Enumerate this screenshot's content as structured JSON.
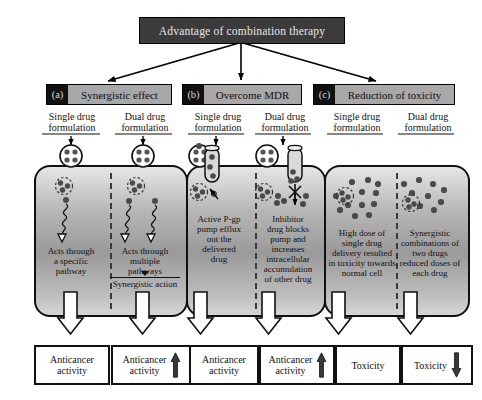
{
  "title": {
    "text": "Advantage of combination therapy"
  },
  "panels": [
    {
      "tag": "(a)",
      "heading": "Synergistic effect",
      "columns": [
        {
          "caption": "Single drug\nformulation",
          "body": "Acts through\na specific\npathway"
        },
        {
          "caption": "Dual drug\nformulation",
          "body": "Acts through\nmultiple\npathways"
        }
      ],
      "note": "Synergistic action",
      "outcomes": [
        {
          "label": "Anticancer\nactivity",
          "arrow": "none"
        },
        {
          "label": "Anticancer\nactivity",
          "arrow": "up"
        }
      ]
    },
    {
      "tag": "(b)",
      "heading": "Overcome MDR",
      "columns": [
        {
          "caption": "Single drug\nformulation",
          "body": "Active P-gp\npump efflux\nout the\ndelivered\ndrug"
        },
        {
          "caption": "Dual drug\nformulation",
          "body": "Inhibitor\ndrug blocks\npump and\nincreases\nintracellular\naccumulation\nof other drug"
        }
      ],
      "note": "",
      "outcomes": [
        {
          "label": "Anticancer\nactivity",
          "arrow": "none"
        },
        {
          "label": "Anticancer\nactivity",
          "arrow": "up"
        }
      ]
    },
    {
      "tag": "(c)",
      "heading": "Reduction of toxicity",
      "columns": [
        {
          "caption": "Single drug\nformulation",
          "body": "High dose of\nsingle drug\ndelivery resulted\nin toxicity towards\nnormal cell"
        },
        {
          "caption": "Dual drug\nformulation",
          "body": "Synergistic\ncombinations of\ntwo drugs\nreduced doses of\neach drug"
        }
      ],
      "note": "",
      "outcomes": [
        {
          "label": "Toxicity",
          "arrow": "none"
        },
        {
          "label": "Toxicity",
          "arrow": "down"
        }
      ]
    }
  ],
  "icons": {
    "nanocarrier": "nanocarrier-icon",
    "pump": "pgp-pump-icon",
    "pathway": "signaling-pathway-icon",
    "drug_dot": "drug-molecule-icon",
    "block": "pump-block-icon",
    "arrow_up": "arrow-up-icon",
    "arrow_down": "arrow-down-icon"
  },
  "colors": {
    "title_bg": "#3b3b3b",
    "title_fg": "#e8e8e8",
    "header_bg": "#a8a8a8",
    "tag_bg": "#111111",
    "cell_stroke": "#111111",
    "drug_dot": "#4a4a4a",
    "outline": "#000000"
  }
}
